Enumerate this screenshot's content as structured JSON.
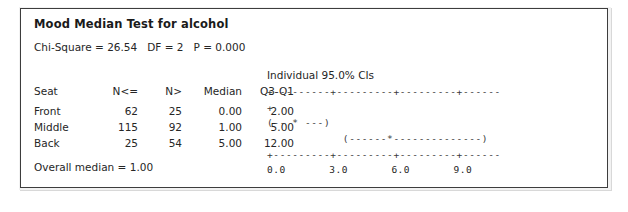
{
  "panel": {
    "title": "Mood Median Test for alcohol",
    "stat_line": "Chi-Square = 26.54   DF = 2   P = 0.000",
    "footer": "Overall median = 1.00"
  },
  "table": {
    "headers": [
      "Seat",
      "N<=",
      "N>",
      "Median",
      "Q3-Q1"
    ],
    "rows": [
      {
        "seat": "Front",
        "n_le": "62",
        "n_gt": "25",
        "median": "0.00",
        "q3q1": "2.00"
      },
      {
        "seat": "Middle",
        "n_le": "115",
        "n_gt": "92",
        "median": "1.00",
        "q3q1": "5.00"
      },
      {
        "seat": "Back",
        "n_le": "25",
        "n_gt": "54",
        "median": "5.00",
        "q3q1": "12.00"
      }
    ]
  },
  "ci_plot": {
    "caption": "Individual 95.0% CIs",
    "axis_top": "+---------+---------+---------+------",
    "axis_bottom": "+---------+---------+---------+------",
    "tick_labels": "0.0       3.0       6.0       9.0",
    "rows": [
      "+",
      "(-- * ---)",
      "            (------*--------------)"
    ]
  },
  "chart_data": {
    "type": "table",
    "title": "Mood Median Test for alcohol",
    "subtitle": "Chi-Square = 26.54   DF = 2   P = 0.000",
    "columns": [
      "Seat",
      "N<=",
      "N>",
      "Median",
      "Q3-Q1"
    ],
    "rows": [
      [
        "Front",
        62,
        25,
        0.0,
        2.0
      ],
      [
        "Middle",
        115,
        92,
        1.0,
        5.0
      ],
      [
        "Back",
        25,
        54,
        5.0,
        12.0
      ]
    ],
    "chi_square": 26.54,
    "df": 2,
    "p_value": 0.0,
    "overall_median": 1.0,
    "ci_panel": {
      "caption": "Individual 95.0% CIs",
      "axis_ticks": [
        0.0,
        3.0,
        6.0,
        9.0
      ],
      "xlabel": "",
      "intervals": [
        {
          "group": "Front",
          "center": 0.0,
          "lower": 0.0,
          "upper": 0.0
        },
        {
          "group": "Middle",
          "center": 1.0,
          "lower": 0.0,
          "upper": 2.0
        },
        {
          "group": "Back",
          "center": 5.0,
          "lower": 3.4,
          "upper": 11.3
        }
      ]
    }
  }
}
